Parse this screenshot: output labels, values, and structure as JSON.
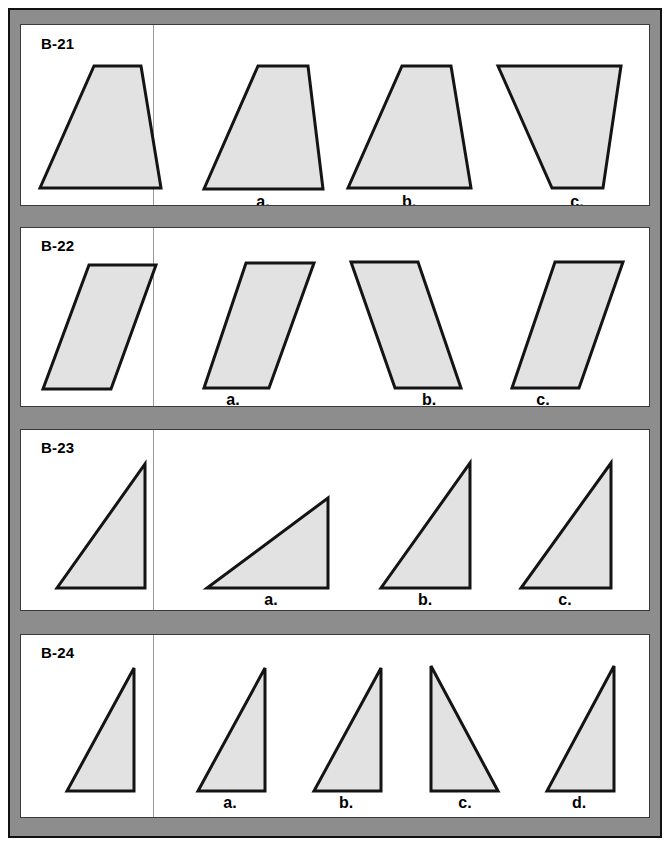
{
  "page": {
    "background_color": "#ffffff",
    "frame_color": "#8d8d8d",
    "frame_border_color": "#111111",
    "panel_background": "#ffffff",
    "panel_border_color": "#3a3a3a",
    "shape_fill": "#e2e2e2",
    "shape_stroke": "#141414"
  },
  "rows": [
    {
      "id": "B-21",
      "label": "B-21",
      "panel": {
        "x": 20,
        "y": 24,
        "w": 630,
        "h": 182
      },
      "divider_x": 152,
      "label_pos": {
        "x": 40,
        "y": 34
      },
      "prompt": {
        "name": "prompt-shape-trapezoid",
        "shape_type": "trapezoid",
        "points": "93,65 140,65 160,187 39,187"
      },
      "options": [
        {
          "key": "a",
          "label": "a.",
          "label_pos": {
            "x": 262,
            "y": 192
          },
          "shape_type": "trapezoid",
          "points": "257,65 307,65 322,188 203,188"
        },
        {
          "key": "b",
          "label": "b.",
          "label_pos": {
            "x": 408,
            "y": 192
          },
          "shape_type": "trapezoid",
          "points": "401,65 450,65 470,187 347,187"
        },
        {
          "key": "c",
          "label": "c.",
          "label_pos": {
            "x": 576,
            "y": 192
          },
          "shape_type": "inverted-trapezoid",
          "points": "497,65 620,65 602,187 551,187"
        }
      ]
    },
    {
      "id": "B-22",
      "label": "B-22",
      "panel": {
        "x": 20,
        "y": 227,
        "w": 630,
        "h": 180
      },
      "divider_x": 152,
      "label_pos": {
        "x": 40,
        "y": 236
      },
      "prompt": {
        "name": "prompt-shape-parallelogram",
        "shape_type": "parallelogram",
        "points": "88,264 155,264 110,388 42,388"
      },
      "options": [
        {
          "key": "a",
          "label": "a.",
          "label_pos": {
            "x": 232,
            "y": 390
          },
          "shape_type": "parallelogram",
          "points": "245,262 313,262 268,387 203,387"
        },
        {
          "key": "b",
          "label": "b.",
          "label_pos": {
            "x": 428,
            "y": 390
          },
          "shape_type": "parallelogram-mirrored",
          "points": "350,261 417,261 460,387 394,387"
        },
        {
          "key": "c",
          "label": "c.",
          "label_pos": {
            "x": 542,
            "y": 390
          },
          "shape_type": "parallelogram",
          "points": "554,261 622,261 578,387 511,387"
        }
      ]
    },
    {
      "id": "B-23",
      "label": "B-23",
      "panel": {
        "x": 20,
        "y": 429,
        "w": 630,
        "h": 182
      },
      "divider_x": 152,
      "label_pos": {
        "x": 40,
        "y": 438
      },
      "prompt": {
        "name": "prompt-shape-right-triangle",
        "shape_type": "right-triangle",
        "points": "144,463 144,587 56,587"
      },
      "options": [
        {
          "key": "a",
          "label": "a.",
          "label_pos": {
            "x": 270,
            "y": 590
          },
          "shape_type": "right-triangle",
          "points": "327,497 327,587 206,587"
        },
        {
          "key": "b",
          "label": "b.",
          "label_pos": {
            "x": 424,
            "y": 590
          },
          "shape_type": "right-triangle",
          "points": "469,462 469,587 380,587"
        },
        {
          "key": "c",
          "label": "c.",
          "label_pos": {
            "x": 564,
            "y": 590
          },
          "shape_type": "right-triangle",
          "points": "610,462 610,587 520,587"
        }
      ]
    },
    {
      "id": "B-24",
      "label": "B-24",
      "panel": {
        "x": 20,
        "y": 634,
        "w": 630,
        "h": 184
      },
      "divider_x": 152,
      "label_pos": {
        "x": 40,
        "y": 643
      },
      "prompt": {
        "name": "prompt-shape-narrow-triangle",
        "shape_type": "right-triangle",
        "points": "133,667 133,790 66,790"
      },
      "options": [
        {
          "key": "a",
          "label": "a.",
          "label_pos": {
            "x": 229,
            "y": 793
          },
          "shape_type": "right-triangle",
          "points": "264,667 264,790 197,790"
        },
        {
          "key": "b",
          "label": "b.",
          "label_pos": {
            "x": 345,
            "y": 793
          },
          "shape_type": "right-triangle",
          "points": "380,667 380,790 313,790"
        },
        {
          "key": "c",
          "label": "c.",
          "label_pos": {
            "x": 464,
            "y": 793
          },
          "shape_type": "right-triangle-mirrored",
          "points": "430,665 497,790 430,790"
        },
        {
          "key": "d",
          "label": "d.",
          "label_pos": {
            "x": 578,
            "y": 793
          },
          "shape_type": "right-triangle",
          "points": "613,665 613,790 546,790"
        }
      ]
    }
  ]
}
